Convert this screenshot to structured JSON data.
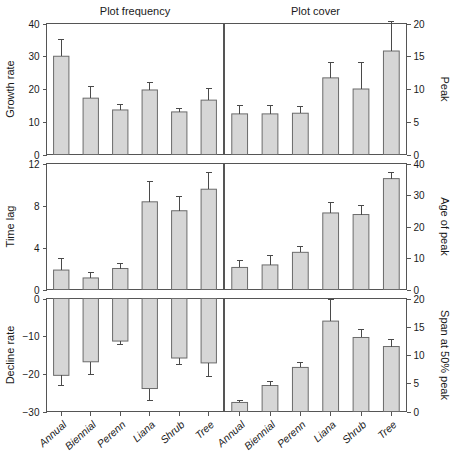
{
  "figure": {
    "column_titles": [
      "Plot frequency",
      "Plot cover"
    ],
    "categories": [
      "Annual",
      "Biennial",
      "Perenn",
      "Liana",
      "Shrub",
      "Tree"
    ]
  },
  "chart_data": [
    {
      "type": "bar",
      "title": "Plot frequency",
      "panel_row": 0,
      "panel_col": 0,
      "ylabel": "Growth rate",
      "xlabel": "",
      "categories": [
        "Annual",
        "Biennial",
        "Perenn",
        "Liana",
        "Shrub",
        "Tree"
      ],
      "values": [
        30.0,
        17.2,
        13.6,
        19.7,
        13.0,
        16.6
      ],
      "errors": [
        5.2,
        3.6,
        1.7,
        2.4,
        1.1,
        3.6
      ],
      "ylim": [
        0,
        40
      ],
      "yticks": [
        0,
        10,
        20,
        30,
        40
      ],
      "ytick_labels": [
        "0",
        "10",
        "20",
        "30",
        "40"
      ],
      "grid": false
    },
    {
      "type": "bar",
      "title": "Plot cover",
      "panel_row": 0,
      "panel_col": 1,
      "ylabel": "Peak",
      "xlabel": "",
      "categories": [
        "Annual",
        "Biennial",
        "Perenn",
        "Liana",
        "Shrub",
        "Tree"
      ],
      "values": [
        6.2,
        6.2,
        6.3,
        11.7,
        10.0,
        15.8
      ],
      "errors": [
        1.3,
        1.3,
        1.0,
        2.4,
        4.0,
        4.5
      ],
      "ylim": [
        0,
        20
      ],
      "yticks": [
        0,
        5,
        10,
        15,
        20
      ],
      "ytick_labels": [
        "0",
        "5",
        "10",
        "15",
        "20"
      ],
      "grid": false
    },
    {
      "type": "bar",
      "title": "",
      "panel_row": 1,
      "panel_col": 0,
      "ylabel": "Time lag",
      "xlabel": "",
      "categories": [
        "Annual",
        "Biennial",
        "Perenn",
        "Liana",
        "Shrub",
        "Tree"
      ],
      "values": [
        1.85,
        1.1,
        2.0,
        8.35,
        7.5,
        9.55
      ],
      "errors": [
        1.1,
        0.5,
        0.45,
        1.9,
        1.4,
        1.6
      ],
      "ylim": [
        0,
        12
      ],
      "yticks": [
        0,
        4,
        8,
        12
      ],
      "ytick_labels": [
        "0",
        "4",
        "8",
        "12"
      ],
      "grid": false
    },
    {
      "type": "bar",
      "title": "",
      "panel_row": 1,
      "panel_col": 1,
      "ylabel": "Age of peak",
      "xlabel": "",
      "categories": [
        "Annual",
        "Biennial",
        "Perenn",
        "Liana",
        "Shrub",
        "Tree"
      ],
      "values": [
        7.0,
        7.8,
        11.8,
        24.3,
        23.8,
        35.2
      ],
      "errors": [
        2.3,
        3.0,
        2.0,
        3.3,
        2.8,
        1.8
      ],
      "ylim": [
        0,
        40
      ],
      "yticks": [
        0,
        10,
        20,
        30,
        40
      ],
      "ytick_labels": [
        "0",
        "10",
        "20",
        "30",
        "40"
      ],
      "grid": false
    },
    {
      "type": "bar",
      "title": "",
      "panel_row": 2,
      "panel_col": 0,
      "ylabel": "Decline rate",
      "xlabel": "",
      "categories": [
        "Annual",
        "Biennial",
        "Perenn",
        "Liana",
        "Shrub",
        "Tree"
      ],
      "values": [
        -20.4,
        -16.8,
        -11.3,
        -23.9,
        -15.8,
        -17.1
      ],
      "errors": [
        2.6,
        3.5,
        0.9,
        3.1,
        1.8,
        3.6
      ],
      "ylim": [
        -30,
        0
      ],
      "yticks": [
        -30,
        -20,
        -10,
        0
      ],
      "ytick_labels": [
        "-30",
        "-20",
        "-10",
        "0"
      ],
      "grid": false
    },
    {
      "type": "bar",
      "title": "",
      "panel_row": 2,
      "panel_col": 1,
      "ylabel": "Span at 50% peak",
      "xlabel": "",
      "categories": [
        "Annual",
        "Biennial",
        "Perenn",
        "Liana",
        "Shrub",
        "Tree"
      ],
      "values": [
        1.6,
        4.6,
        7.8,
        16.0,
        13.1,
        11.5
      ],
      "errors": [
        0.4,
        0.7,
        0.8,
        3.8,
        1.5,
        1.2
      ],
      "ylim": [
        0,
        20
      ],
      "yticks": [
        0,
        5,
        10,
        15,
        20
      ],
      "ytick_labels": [
        "0",
        "5",
        "10",
        "15",
        "20"
      ],
      "grid": false
    }
  ]
}
